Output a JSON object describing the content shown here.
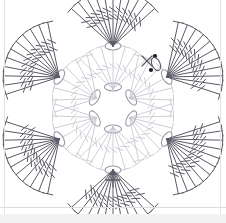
{
  "document": {
    "title": "Crochet Flower Motif Chart",
    "kind": "crochet-stitch-diagram",
    "background_color": "#ffffff"
  },
  "palette": {
    "outer_stroke": "#5a5a66",
    "inner_stroke": "#c2c2cc",
    "center_stroke": "#9a9aa6",
    "marker_fill": "#1a1a1a",
    "border_gray": "#e3e3e3",
    "band_gray": "#f2f2f2"
  },
  "geometry": {
    "center": {
      "x": 113,
      "y": 108
    },
    "center_ring_radius": 21,
    "petal_node_radius": 62,
    "inner_fan_length": 44,
    "outer_fan_length": 56
  },
  "chart_data": {
    "type": "diagram",
    "rounds": [
      {
        "name": "center-ring",
        "symbol": "chain-stitch-oval",
        "count": 6,
        "stroke": "#9a9aa6",
        "note": "magic ring of 6 chain ovals"
      },
      {
        "name": "round-1-inner-fans",
        "symbol": "treble-crochet",
        "fans": 6,
        "stitches_per_fan": 7,
        "stroke": "#c2c2cc",
        "note": "light grey inner shell stitches"
      },
      {
        "name": "round-2-outer-fans",
        "symbol": "double-treble-crochet",
        "fans": 6,
        "stitches_per_fan": 11,
        "slashes_per_stitch": 2,
        "stroke": "#5a5a66",
        "note": "dark outer petal shells with T-bar caps"
      }
    ],
    "petal_nodes": [
      {
        "id": "petal-top",
        "angle_deg": -90,
        "label": "top"
      },
      {
        "id": "petal-upper-right",
        "angle_deg": -30,
        "label": "upper right"
      },
      {
        "id": "petal-lower-right",
        "angle_deg": 30,
        "label": "lower right"
      },
      {
        "id": "petal-bottom-right",
        "angle_deg": 90,
        "label": "bottom right"
      },
      {
        "id": "petal-lower-left",
        "angle_deg": 150,
        "label": "bottom left"
      },
      {
        "id": "petal-upper-left",
        "angle_deg": 210,
        "label": "upper left"
      }
    ],
    "annotations": [
      {
        "id": "single-crochet-key",
        "symbol": "+",
        "meaning": "single crochet",
        "x": 113,
        "y": 180
      },
      {
        "id": "slip-stitch-dot-upper",
        "symbol": "•",
        "meaning": "slip stitch",
        "x": 155,
        "y": 56
      },
      {
        "id": "slip-stitch-dot-lower",
        "symbol": "•",
        "meaning": "slip stitch",
        "x": 151,
        "y": 70
      },
      {
        "id": "single-crochet-x-marker",
        "symbol": "x",
        "meaning": "single crochet",
        "x": 147,
        "y": 61
      },
      {
        "id": "chain-oval-marker",
        "symbol": "oval",
        "meaning": "chain stitch",
        "x": 156,
        "y": 64
      }
    ]
  },
  "legend": {
    "items": [
      {
        "symbol": "+",
        "label": "single crochet"
      },
      {
        "symbol": "•",
        "label": "slip stitch"
      },
      {
        "symbol": "oval",
        "label": "chain stitch"
      },
      {
        "symbol": "T/",
        "label": "treble crochet"
      },
      {
        "symbol": "T//",
        "label": "double treble crochet"
      }
    ]
  }
}
